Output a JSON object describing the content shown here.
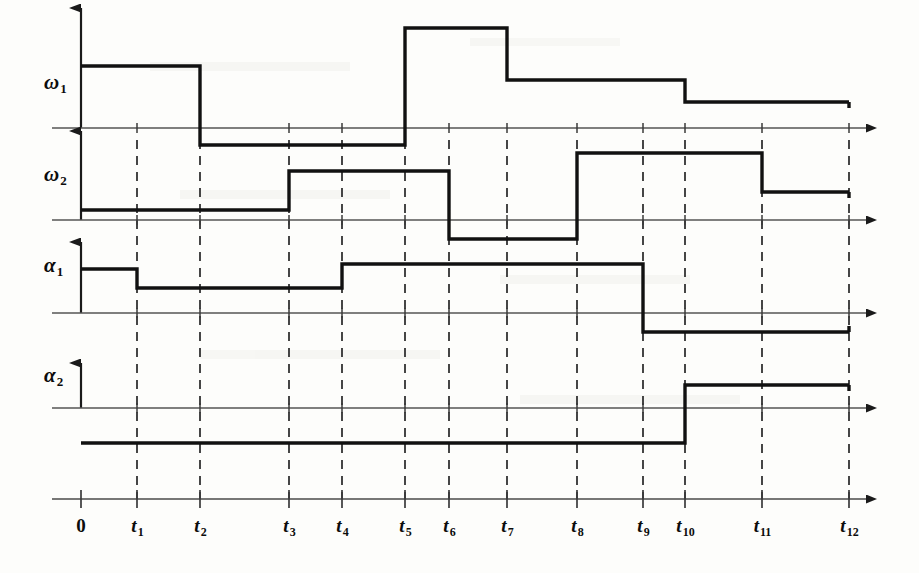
{
  "figure": {
    "kind": "timing-diagram",
    "background_color": "#fdfdfb",
    "axis_color": "#4a4a4a",
    "wave_color": "#111111",
    "grid_color": "#333333"
  },
  "signals": [
    {
      "key": "w1",
      "label": "ω",
      "subscript": "1",
      "label_x": 44,
      "label_y": 70
    },
    {
      "key": "w2",
      "label": "ω",
      "subscript": "2",
      "label_x": 44,
      "label_y": 162
    },
    {
      "key": "a1",
      "label": "α",
      "subscript": "1",
      "label_x": 44,
      "label_y": 253
    },
    {
      "key": "a2",
      "label": "α",
      "subscript": "2",
      "label_x": 44,
      "label_y": 363
    }
  ],
  "time_axis": {
    "label_y": 515,
    "baseline_y": 499,
    "ticks": [
      {
        "label": "0",
        "subscript": "",
        "x": 81
      },
      {
        "label": "t",
        "subscript": "1",
        "x": 137
      },
      {
        "label": "t",
        "subscript": "2",
        "x": 200
      },
      {
        "label": "t",
        "subscript": "3",
        "x": 289
      },
      {
        "label": "t",
        "subscript": "4",
        "x": 342
      },
      {
        "label": "t",
        "subscript": "5",
        "x": 405
      },
      {
        "label": "t",
        "subscript": "6",
        "x": 449
      },
      {
        "label": "t",
        "subscript": "7",
        "x": 507
      },
      {
        "label": "t",
        "subscript": "8",
        "x": 577
      },
      {
        "label": "t",
        "subscript": "9",
        "x": 643
      },
      {
        "label": "t",
        "subscript": "10",
        "x": 685
      },
      {
        "label": "t",
        "subscript": "11",
        "x": 762
      },
      {
        "label": "t",
        "subscript": "12",
        "x": 849
      }
    ]
  },
  "chart_data": {
    "type": "line",
    "title": "",
    "xlabel": "",
    "ylabel": "",
    "grid": true,
    "legend": "none",
    "x": [
      "0",
      "t1",
      "t2",
      "t3",
      "t4",
      "t5",
      "t6",
      "t7",
      "t8",
      "t9",
      "t10",
      "t11",
      "t12"
    ],
    "x_pixels": [
      81,
      137,
      200,
      289,
      342,
      405,
      449,
      507,
      577,
      643,
      685,
      762,
      849
    ],
    "series": [
      {
        "name": "ω₁",
        "axis_y": 128,
        "segments": [
          {
            "from": "0",
            "to": "t2",
            "level": "high",
            "y": 66
          },
          {
            "from": "t2",
            "to": "t5",
            "level": "below-zero",
            "y": 145
          },
          {
            "from": "t5",
            "to": "t7",
            "level": "very-high",
            "y": 28
          },
          {
            "from": "t7",
            "to": "t10",
            "level": "mid-high",
            "y": 80
          },
          {
            "from": "t10",
            "to": "t12",
            "level": "low-high",
            "y": 102
          }
        ]
      },
      {
        "name": "ω₂",
        "axis_y": 220,
        "segments": [
          {
            "from": "0",
            "to": "t3",
            "level": "low",
            "y": 210
          },
          {
            "from": "t3",
            "to": "t6",
            "level": "mid",
            "y": 171
          },
          {
            "from": "t6",
            "to": "t8",
            "level": "below-zero",
            "y": 239
          },
          {
            "from": "t8",
            "to": "t11",
            "level": "high",
            "y": 153
          },
          {
            "from": "t11",
            "to": "t12",
            "level": "mid-low",
            "y": 192
          }
        ]
      },
      {
        "name": "α₁",
        "axis_y": 313,
        "segments": [
          {
            "from": "0",
            "to": "t1",
            "level": "high",
            "y": 269
          },
          {
            "from": "t1",
            "to": "t4",
            "level": "mid",
            "y": 288
          },
          {
            "from": "t4",
            "to": "t9",
            "level": "high",
            "y": 264
          },
          {
            "from": "t9",
            "to": "t12",
            "level": "below-zero",
            "y": 332
          }
        ]
      },
      {
        "name": "α₂",
        "axis_y": 408,
        "segments": [
          {
            "from": "0",
            "to": "t10",
            "level": "below-zero",
            "y": 443
          },
          {
            "from": "t10",
            "to": "t12",
            "level": "high",
            "y": 385
          }
        ]
      }
    ],
    "vertical_grid_lines": {
      "style": "dashed",
      "at": [
        "t1",
        "t2",
        "t3",
        "t4",
        "t5",
        "t6",
        "t7",
        "t8",
        "t9",
        "t10",
        "t11",
        "t12"
      ],
      "top_y": 140,
      "bottom_y": 499
    }
  }
}
